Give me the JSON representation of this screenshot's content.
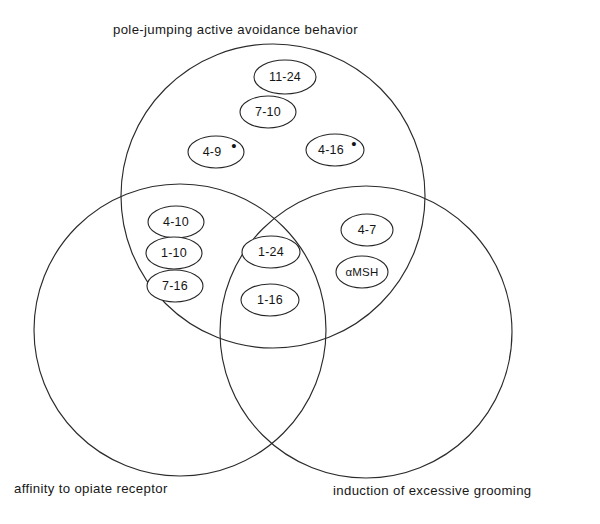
{
  "figure": {
    "type": "venn-diagram-3-set",
    "background_color": "#ffffff",
    "stroke_color": "#2b2b2b"
  },
  "sets": {
    "top": {
      "caption": "pole-jumping active avoidance behavior",
      "name": "pole-jumping-active-avoidance-behavior"
    },
    "left": {
      "caption": "affinity to opiate receptor",
      "name": "affinity-to-opiate-receptor"
    },
    "right": {
      "caption": "induction of excessive grooming",
      "name": "induction-of-excessive-grooming"
    }
  },
  "regions": {
    "top_only": {
      "label": "top-only-region",
      "items": [
        {
          "text": "11-24",
          "mark": ""
        },
        {
          "text": "7-10",
          "mark": ""
        },
        {
          "text": "4-9",
          "mark": "•"
        },
        {
          "text": "4-16",
          "mark": "•"
        }
      ]
    },
    "top_left": {
      "label": "top-left-intersection",
      "items": [
        {
          "text": "4-10",
          "mark": ""
        },
        {
          "text": "1-10",
          "mark": ""
        },
        {
          "text": "7-16",
          "mark": ""
        }
      ]
    },
    "center": {
      "label": "center-triple-intersection",
      "items": [
        {
          "text": "1-24",
          "mark": ""
        },
        {
          "text": "1-16",
          "mark": ""
        }
      ]
    },
    "top_right": {
      "label": "top-right-intersection",
      "items": [
        {
          "text": "4-7",
          "mark": ""
        },
        {
          "text": "αMSH",
          "mark": ""
        }
      ]
    }
  },
  "nodes": [
    {
      "id": "n0",
      "text": "11-24",
      "mark": "",
      "cx": 285,
      "cy": 77,
      "rx": 31,
      "ry": 17,
      "size": "normal"
    },
    {
      "id": "n1",
      "text": "7-10",
      "mark": "",
      "cx": 268,
      "cy": 112,
      "rx": 28,
      "ry": 16,
      "size": "normal"
    },
    {
      "id": "n2",
      "text": "4-9",
      "mark": "•",
      "cx": 216,
      "cy": 152,
      "rx": 28,
      "ry": 16,
      "size": "normal"
    },
    {
      "id": "n3",
      "text": "4-16",
      "mark": "•",
      "cx": 335,
      "cy": 150,
      "rx": 29,
      "ry": 16,
      "size": "normal"
    },
    {
      "id": "n4",
      "text": "4-10",
      "mark": "",
      "cx": 176,
      "cy": 222,
      "rx": 28,
      "ry": 16,
      "size": "normal"
    },
    {
      "id": "n5",
      "text": "1-10",
      "mark": "",
      "cx": 174,
      "cy": 253,
      "rx": 28,
      "ry": 16,
      "size": "normal"
    },
    {
      "id": "n6",
      "text": "7-16",
      "mark": "",
      "cx": 175,
      "cy": 286,
      "rx": 28,
      "ry": 16,
      "size": "normal"
    },
    {
      "id": "n7",
      "text": "1-24",
      "mark": "",
      "cx": 271,
      "cy": 252,
      "rx": 29,
      "ry": 16,
      "size": "normal"
    },
    {
      "id": "n8",
      "text": "1-16",
      "mark": "",
      "cx": 270,
      "cy": 300,
      "rx": 29,
      "ry": 16,
      "size": "normal"
    },
    {
      "id": "n9",
      "text": "4-7",
      "mark": "",
      "cx": 367,
      "cy": 230,
      "rx": 26,
      "ry": 16,
      "size": "normal"
    },
    {
      "id": "n10",
      "text": "αMSH",
      "mark": "",
      "cx": 362,
      "cy": 272,
      "rx": 26,
      "ry": 16,
      "size": "small"
    }
  ],
  "circles": [
    {
      "id": "c-top",
      "name": "circle-pole-jumping",
      "cx": 273,
      "cy": 196,
      "r": 152
    },
    {
      "id": "c-left",
      "name": "circle-opiate",
      "cx": 180,
      "cy": 330,
      "r": 146
    },
    {
      "id": "c-right",
      "name": "circle-grooming",
      "cx": 366,
      "cy": 332,
      "r": 146
    }
  ]
}
